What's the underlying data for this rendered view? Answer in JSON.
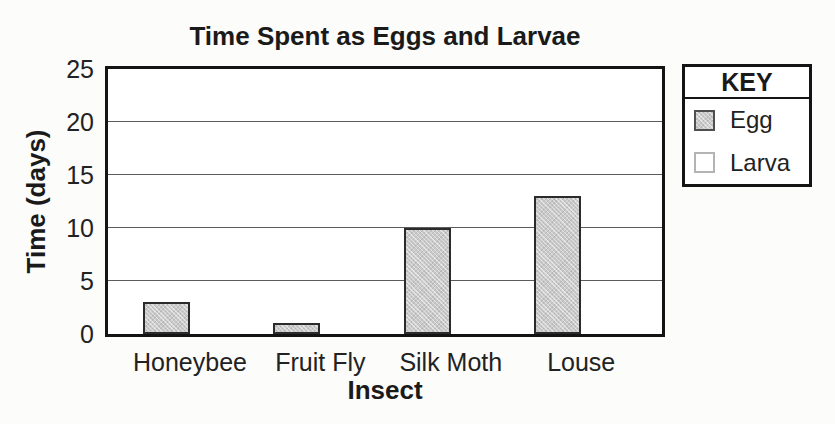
{
  "chart_data": {
    "type": "bar",
    "title": "Time Spent as Eggs and Larvae",
    "xlabel": "Insect",
    "ylabel": "Time (days)",
    "categories": [
      "Honeybee",
      "Fruit Fly",
      "Silk Moth",
      "Louse"
    ],
    "series": [
      {
        "name": "Egg",
        "values": [
          3,
          1,
          10,
          13
        ],
        "fill": "#cacaca",
        "border": "#2b2b2b",
        "texture": "halftone"
      }
    ],
    "ylim": [
      0,
      25
    ],
    "yticks": [
      0,
      5,
      10,
      15,
      20,
      25
    ],
    "grid": true,
    "legend_position": "right",
    "note_visible_bars": "only Egg bars are drawn; Larva appears in key only"
  },
  "legend": {
    "title": "KEY",
    "items": [
      {
        "label": "Egg",
        "fill": "#cacaca",
        "border": "#4f4f4f",
        "texture": "halftone"
      },
      {
        "label": "Larva",
        "fill": "#ffffff",
        "border": "#b4b4b4",
        "texture": "none"
      }
    ]
  },
  "colors": {
    "frame": "#141414",
    "gridline": "#5c5c5c",
    "text": "#1c1c1c",
    "paper": "#fcfcfa"
  }
}
